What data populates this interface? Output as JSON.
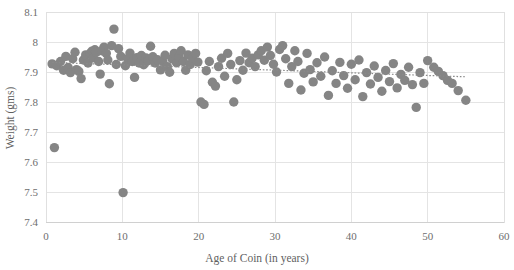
{
  "chart_data": {
    "type": "scatter",
    "title": "",
    "xlabel": "Age of Coin (in years)",
    "ylabel": "Weight (gms)",
    "xlim": [
      0,
      60
    ],
    "ylim": [
      7.4,
      8.1
    ],
    "xticks": [
      "0",
      "10",
      "20",
      "30",
      "40",
      "50",
      "60"
    ],
    "yticks": [
      "7.4",
      "7.5",
      "7.6",
      "7.7",
      "7.8",
      "7.9",
      "8",
      "8.1"
    ],
    "xtick_values": [
      0,
      10,
      20,
      30,
      40,
      50,
      60
    ],
    "ytick_values": [
      7.4,
      7.5,
      7.6,
      7.7,
      7.8,
      7.9,
      8.0,
      8.1
    ],
    "grid": "horizontal-and-vertical",
    "legend": "none",
    "marker_color": "#858585",
    "marker_size": 5.2,
    "series": [
      {
        "name": "Coin weight vs age",
        "points": [
          [
            0.8,
            7.927
          ],
          [
            1.1,
            7.648
          ],
          [
            1.4,
            7.921
          ],
          [
            1.9,
            7.935
          ],
          [
            2.3,
            7.906
          ],
          [
            2.6,
            7.952
          ],
          [
            2.9,
            7.915
          ],
          [
            3.2,
            7.898
          ],
          [
            3.5,
            7.944
          ],
          [
            3.8,
            7.966
          ],
          [
            4.0,
            7.908
          ],
          [
            4.3,
            7.902
          ],
          [
            4.6,
            7.878
          ],
          [
            4.9,
            7.94
          ],
          [
            5.2,
            7.957
          ],
          [
            5.5,
            7.93
          ],
          [
            5.8,
            7.962
          ],
          [
            6.0,
            7.969
          ],
          [
            6.2,
            7.947
          ],
          [
            6.4,
            7.974
          ],
          [
            6.6,
            7.966
          ],
          [
            6.9,
            7.935
          ],
          [
            7.1,
            7.893
          ],
          [
            7.3,
            7.971
          ],
          [
            7.6,
            7.983
          ],
          [
            7.9,
            7.962
          ],
          [
            8.1,
            7.94
          ],
          [
            8.3,
            7.861
          ],
          [
            8.6,
            7.988
          ],
          [
            8.9,
            8.043
          ],
          [
            9.2,
            7.925
          ],
          [
            9.5,
            7.978
          ],
          [
            9.8,
            7.952
          ],
          [
            10.1,
            7.498
          ],
          [
            10.4,
            7.921
          ],
          [
            10.7,
            7.944
          ],
          [
            11.0,
            7.963
          ],
          [
            11.3,
            7.935
          ],
          [
            11.6,
            7.882
          ],
          [
            11.9,
            7.948
          ],
          [
            12.2,
            7.93
          ],
          [
            12.5,
            7.955
          ],
          [
            12.8,
            7.924
          ],
          [
            13.1,
            7.947
          ],
          [
            13.4,
            7.938
          ],
          [
            13.7,
            7.986
          ],
          [
            14.0,
            7.951
          ],
          [
            14.3,
            7.93
          ],
          [
            14.6,
            7.941
          ],
          [
            15.0,
            7.907
          ],
          [
            15.3,
            7.935
          ],
          [
            15.6,
            7.956
          ],
          [
            15.9,
            7.918
          ],
          [
            16.2,
            7.899
          ],
          [
            16.5,
            7.944
          ],
          [
            16.8,
            7.962
          ],
          [
            17.1,
            7.931
          ],
          [
            17.4,
            7.951
          ],
          [
            17.7,
            7.971
          ],
          [
            18.0,
            7.935
          ],
          [
            18.3,
            7.906
          ],
          [
            18.6,
            7.957
          ],
          [
            18.9,
            7.925
          ],
          [
            19.2,
            7.946
          ],
          [
            19.6,
            7.962
          ],
          [
            19.9,
            7.933
          ],
          [
            20.3,
            7.8
          ],
          [
            20.7,
            7.792
          ],
          [
            21.0,
            7.904
          ],
          [
            21.4,
            7.935
          ],
          [
            21.8,
            7.866
          ],
          [
            22.2,
            7.853
          ],
          [
            22.6,
            7.918
          ],
          [
            23.0,
            7.946
          ],
          [
            23.4,
            7.886
          ],
          [
            23.8,
            7.962
          ],
          [
            24.2,
            7.925
          ],
          [
            24.6,
            7.8
          ],
          [
            25.0,
            7.874
          ],
          [
            25.4,
            7.938
          ],
          [
            25.8,
            7.906
          ],
          [
            26.2,
            7.963
          ],
          [
            26.6,
            7.931
          ],
          [
            27.0,
            7.946
          ],
          [
            27.4,
            7.918
          ],
          [
            27.8,
            7.957
          ],
          [
            28.2,
            7.971
          ],
          [
            28.6,
            7.939
          ],
          [
            29.0,
            7.983
          ],
          [
            29.4,
            7.955
          ],
          [
            29.8,
            7.926
          ],
          [
            30.2,
            7.9
          ],
          [
            30.6,
            7.975
          ],
          [
            31.0,
            7.988
          ],
          [
            31.4,
            7.944
          ],
          [
            31.8,
            7.862
          ],
          [
            32.2,
            7.918
          ],
          [
            32.6,
            7.971
          ],
          [
            33.0,
            7.935
          ],
          [
            33.4,
            7.84
          ],
          [
            33.8,
            7.896
          ],
          [
            34.2,
            7.962
          ],
          [
            34.6,
            7.908
          ],
          [
            35.0,
            7.867
          ],
          [
            35.5,
            7.931
          ],
          [
            36.0,
            7.886
          ],
          [
            36.5,
            7.95
          ],
          [
            37.0,
            7.822
          ],
          [
            37.5,
            7.904
          ],
          [
            38.0,
            7.862
          ],
          [
            38.5,
            7.932
          ],
          [
            39.0,
            7.888
          ],
          [
            39.5,
            7.846
          ],
          [
            40.0,
            7.926
          ],
          [
            40.5,
            7.874
          ],
          [
            41.0,
            7.94
          ],
          [
            41.5,
            7.818
          ],
          [
            42.0,
            7.898
          ],
          [
            42.5,
            7.86
          ],
          [
            43.0,
            7.92
          ],
          [
            43.5,
            7.882
          ],
          [
            44.0,
            7.836
          ],
          [
            44.5,
            7.905
          ],
          [
            45.0,
            7.868
          ],
          [
            45.5,
            7.928
          ],
          [
            46.0,
            7.847
          ],
          [
            46.5,
            7.892
          ],
          [
            47.0,
            7.872
          ],
          [
            47.5,
            7.916
          ],
          [
            48.0,
            7.858
          ],
          [
            48.5,
            7.782
          ],
          [
            49.0,
            7.898
          ],
          [
            49.5,
            7.862
          ],
          [
            50.0,
            7.938
          ],
          [
            50.8,
            7.916
          ],
          [
            51.4,
            7.902
          ],
          [
            52.0,
            7.888
          ],
          [
            52.6,
            7.872
          ],
          [
            53.2,
            7.862
          ],
          [
            54.0,
            7.838
          ],
          [
            55.0,
            7.806
          ]
        ]
      }
    ],
    "trendline": {
      "type": "linear",
      "style": "dotted",
      "color": "#8a8a8a",
      "x_start": 0.8,
      "x_end": 55.0,
      "y_start": 7.932,
      "y_end": 7.884
    }
  }
}
